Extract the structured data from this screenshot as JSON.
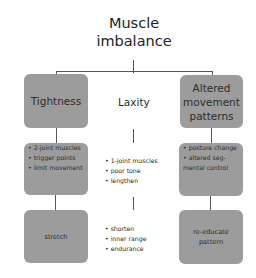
{
  "title": {
    "line1": "Muscle",
    "line2": "imbalance"
  },
  "columns": {
    "left": {
      "heading": "Tightness",
      "characteristics": [
        "2-joint muscles",
        "trigger points",
        "limit movement"
      ],
      "treatment": "stretch"
    },
    "center": {
      "heading": "Laxity",
      "characteristics": [
        "1-joint muscles",
        "poor tone",
        "lengthen"
      ],
      "treatment": [
        "shorten",
        "inner range",
        "endurance"
      ]
    },
    "right": {
      "heading": {
        "line1": "Altered",
        "line2": "movement",
        "line3": "patterns"
      },
      "characteristics": {
        "item1": "posture change",
        "item2": "altered seg-",
        "item2_cont": "mental control"
      },
      "treatment": {
        "line1": "re-educate",
        "line2": "pattern"
      }
    }
  },
  "colors": {
    "box_fill": "#9c9c9c",
    "line": "#555555",
    "background": "#ffffff"
  }
}
